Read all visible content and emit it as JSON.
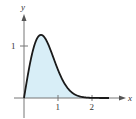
{
  "chart_data": {
    "type": "area",
    "title": "",
    "xlabel": "x",
    "ylabel": "y",
    "function": "4x e^(-2x^2)",
    "x_ticks": [
      "1",
      "2"
    ],
    "y_ticks": [
      "1"
    ],
    "xlim": [
      0,
      2.7
    ],
    "ylim": [
      0,
      1.6
    ],
    "grid": false,
    "fill_color": "#d8eef7",
    "line_color": "#1a1a1a",
    "x": [
      0,
      0.1,
      0.2,
      0.3,
      0.4,
      0.5,
      0.6,
      0.7,
      0.8,
      0.9,
      1.0,
      1.2,
      1.4,
      1.6,
      1.8,
      2.0
    ],
    "values": [
      0,
      0.39,
      0.74,
      1.0,
      1.16,
      1.21,
      1.17,
      1.05,
      0.89,
      0.71,
      0.54,
      0.27,
      0.11,
      0.04,
      0.01,
      0.0
    ],
    "shaded_region": "area under curve from x=0 to x=2"
  },
  "labels": {
    "x_axis": "x",
    "y_axis": "y",
    "x_tick_1": "1",
    "x_tick_2": "2",
    "y_tick_1": "1"
  }
}
